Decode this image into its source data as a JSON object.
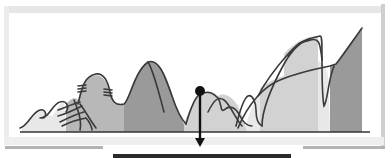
{
  "diagram": {
    "kind": "waveform-peaks-illustration",
    "colors": {
      "curve": "#3a3a3a",
      "baseline": "#333333",
      "band_lightest": "#e8e8e8",
      "band_light": "#d2d2d2",
      "band_mid": "#b8b8b8",
      "band_dark": "#9a9a9a",
      "marker": "#111111",
      "result_bar": "#2a2a2a"
    },
    "bands": [
      {
        "id": "band-1",
        "shade": "band_lightest"
      },
      {
        "id": "band-2",
        "shade": "band_mid"
      },
      {
        "id": "band-3",
        "shade": "band_dark"
      },
      {
        "id": "band-4",
        "shade": "band_light"
      },
      {
        "id": "band-5",
        "shade": "band_light"
      },
      {
        "id": "band-6",
        "shade": "band_lightest"
      },
      {
        "id": "band-7",
        "shade": "band_light"
      },
      {
        "id": "band-8",
        "shade": "band_light"
      },
      {
        "id": "band-9",
        "shade": "band_lightest"
      },
      {
        "id": "band-10",
        "shade": "band_dark"
      }
    ],
    "marker": {
      "icon": "pin-down-arrow-icon"
    }
  }
}
